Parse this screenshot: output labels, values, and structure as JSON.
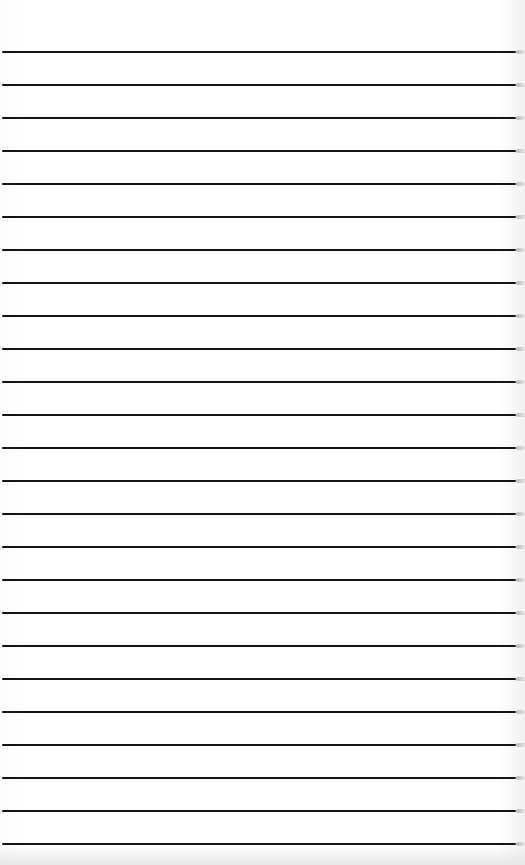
{
  "image": {
    "subject": "lined-paper",
    "description": "Sheet of ruled notebook paper with evenly spaced horizontal black lines",
    "line_count": 25,
    "colors": {
      "paper": "#fdfdfd",
      "rule": "#141414",
      "edge_shadow": "#b9b9b9"
    }
  }
}
